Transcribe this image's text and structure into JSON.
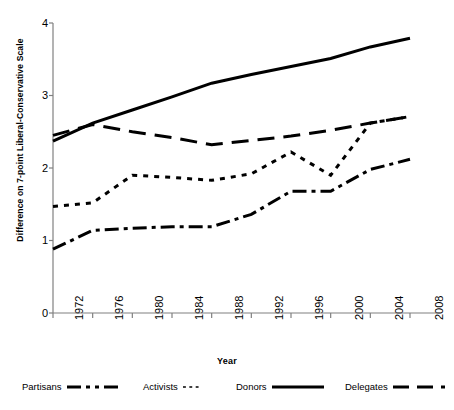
{
  "chart_data": {
    "type": "line",
    "title": "",
    "xlabel": "Year",
    "ylabel": "Difference on 7-point Liberal-Conservative Scale",
    "x": [
      1972,
      1976,
      1980,
      1984,
      1988,
      1992,
      1996,
      2000,
      2004,
      2008
    ],
    "xtick_labels": [
      "1972",
      "1976",
      "1980",
      "1984",
      "1988",
      "1992",
      "1996",
      "2000",
      "2004",
      "2008"
    ],
    "ytick_labels": [
      "0",
      "1",
      "2",
      "3",
      "4"
    ],
    "ytick_values": [
      0,
      1,
      2,
      3,
      4
    ],
    "xlim": [
      1972,
      2008
    ],
    "ylim": [
      0,
      4
    ],
    "grid": false,
    "legend_position": "below-bottom",
    "series": [
      {
        "name": "Partisans",
        "style": "dash-dot",
        "color": "#000000",
        "values": [
          0.88,
          1.14,
          1.17,
          1.19,
          1.19,
          1.36,
          1.68,
          1.68,
          1.98,
          2.12
        ]
      },
      {
        "name": "Activists",
        "style": "short-dash",
        "color": "#000000",
        "values": [
          1.47,
          1.52,
          1.9,
          1.87,
          1.83,
          1.92,
          2.22,
          1.9,
          2.62,
          2.71
        ]
      },
      {
        "name": "Donors",
        "style": "solid",
        "color": "#000000",
        "values": [
          2.37,
          2.62,
          2.8,
          2.98,
          3.17,
          3.29,
          3.4,
          3.51,
          3.67,
          3.79
        ]
      },
      {
        "name": "Delegates",
        "style": "long-dash",
        "color": "#000000",
        "values": [
          2.45,
          2.6,
          2.5,
          2.42,
          2.32,
          2.38,
          2.44,
          2.52,
          2.62,
          2.71
        ]
      }
    ]
  },
  "axes": {
    "y_title": "Difference on 7-point Liberal-Conservative Scale",
    "x_title": "Year",
    "y_ticks": [
      {
        "label": "4"
      },
      {
        "label": "3"
      },
      {
        "label": "2"
      },
      {
        "label": "1"
      },
      {
        "label": "0"
      }
    ],
    "x_ticks": [
      {
        "label": "1972"
      },
      {
        "label": "1976"
      },
      {
        "label": "1980"
      },
      {
        "label": "1984"
      },
      {
        "label": "1988"
      },
      {
        "label": "1992"
      },
      {
        "label": "1996"
      },
      {
        "label": "2000"
      },
      {
        "label": "2004"
      },
      {
        "label": "2008"
      }
    ]
  },
  "legend": {
    "items": [
      {
        "label": "Partisans",
        "style": "dash-dot"
      },
      {
        "label": "Activists",
        "style": "short-dash"
      },
      {
        "label": "Donors",
        "style": "solid"
      },
      {
        "label": "Delegates",
        "style": "long-dash"
      }
    ]
  }
}
